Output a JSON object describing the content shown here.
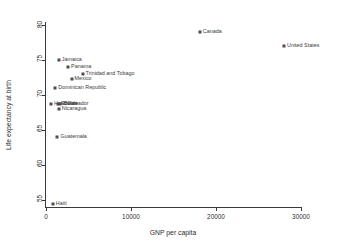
{
  "chart_data": {
    "type": "scatter",
    "title": "",
    "xlabel": "GNP per capita",
    "ylabel": "Life expectancy at birth",
    "xlim": [
      0,
      30000
    ],
    "ylim": [
      54,
      80.5
    ],
    "xticks": [
      0,
      10000,
      20000,
      30000
    ],
    "xtick_labels": [
      "0",
      "10000",
      "20000",
      "30000"
    ],
    "yticks": [
      55,
      60,
      65,
      70,
      75,
      80
    ],
    "ytick_labels": [
      "55",
      "60",
      "65",
      "70",
      "75",
      "80"
    ],
    "grid": false,
    "legend": false,
    "marker_color": "#4d4d4d",
    "axis_color": "#3a3a3a",
    "points": [
      {
        "label": "Canada",
        "x": 18100,
        "y": 79.0
      },
      {
        "label": "United States",
        "x": 28000,
        "y": 77.0
      },
      {
        "label": "Jamaica",
        "x": 1500,
        "y": 75.0
      },
      {
        "label": "Panama",
        "x": 2600,
        "y": 74.0
      },
      {
        "label": "Trinidad and Tobago",
        "x": 4300,
        "y": 73.0
      },
      {
        "label": "Mexico",
        "x": 3000,
        "y": 72.3
      },
      {
        "label": "Dominican Republic",
        "x": 1100,
        "y": 71.0
      },
      {
        "label": "Honduras",
        "x": 590,
        "y": 68.8
      },
      {
        "label": "Belize",
        "x": 1700,
        "y": 68.8
      },
      {
        "label": "El Salvador",
        "x": 1400,
        "y": 68.8
      },
      {
        "label": "Nicaragua",
        "x": 1500,
        "y": 68.0
      },
      {
        "label": "Guatemala",
        "x": 1350,
        "y": 64.0
      },
      {
        "label": "Haiti",
        "x": 800,
        "y": 54.4
      }
    ]
  }
}
